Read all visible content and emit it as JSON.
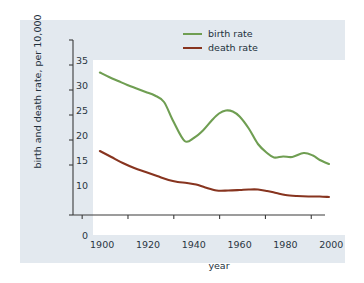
{
  "chart_data": {
    "type": "line",
    "title": "",
    "xlabel": "year",
    "ylabel": "birth and death rate, per 10,000",
    "xlim": [
      1896,
      2006
    ],
    "ylim": [
      0,
      35
    ],
    "grid": false,
    "legend_position": "top-right",
    "xticks": [
      1900,
      1920,
      1940,
      1960,
      1980,
      2000
    ],
    "xtick_labels": [
      "1900",
      "1920",
      "1940",
      "1960",
      "1980",
      "2000"
    ],
    "yticks": [
      0,
      10,
      15,
      20,
      25,
      30,
      35
    ],
    "ytick_labels": [
      "0",
      "10",
      "15",
      "20",
      "25",
      "30",
      "35"
    ],
    "y_axis_note": "axis compressed between 0 and 10; tick 5 omitted",
    "series": [
      {
        "name": "birth rate",
        "color": "#6f9e52",
        "x": [
          1899,
          1903,
          1907,
          1911,
          1915,
          1919,
          1923,
          1927,
          1931,
          1936,
          1940,
          1944,
          1948,
          1951,
          1954,
          1957,
          1960,
          1964,
          1968,
          1972,
          1975,
          1979,
          1983,
          1988,
          1992,
          1995,
          1999
        ],
        "values": [
          32.5,
          31.6,
          30.8,
          30.0,
          29.3,
          28.6,
          27.9,
          26.6,
          22.8,
          18.8,
          19.4,
          20.9,
          23.0,
          24.3,
          24.9,
          24.7,
          23.7,
          21.3,
          18.2,
          16.4,
          15.5,
          15.7,
          15.6,
          16.4,
          15.9,
          15.0,
          14.2
        ]
      },
      {
        "name": "death rate",
        "color": "#87341f",
        "x": [
          1899,
          1904,
          1909,
          1914,
          1919,
          1924,
          1929,
          1933,
          1937,
          1941,
          1945,
          1950,
          1955,
          1960,
          1964,
          1968,
          1972,
          1976,
          1980,
          1985,
          1990,
          1995,
          1999
        ],
        "values": [
          16.8,
          15.6,
          14.4,
          13.4,
          12.6,
          11.8,
          11.0,
          10.6,
          10.4,
          10.1,
          9.5,
          8.9,
          8.9,
          9.0,
          9.1,
          9.1,
          8.8,
          8.4,
          8.0,
          7.8,
          7.7,
          7.7,
          7.6
        ]
      }
    ]
  },
  "legend": {
    "items": [
      {
        "label": "birth rate",
        "color": "#6f9e52"
      },
      {
        "label": "death rate",
        "color": "#87341f"
      }
    ]
  },
  "axes": {
    "x_title": "year",
    "y_title": "birth and death rate, per 10,000"
  }
}
